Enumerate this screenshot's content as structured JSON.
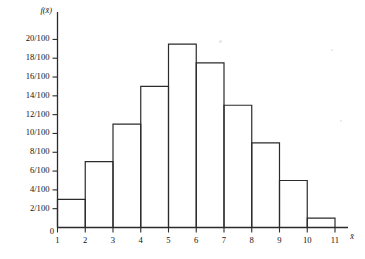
{
  "chart_data": {
    "type": "bar",
    "title": "",
    "xlabel": "x̄",
    "ylabel": "f(x̄)",
    "grid": false,
    "legend": "none",
    "bin_edges": [
      1,
      2,
      3,
      4,
      5,
      6,
      7,
      8,
      9,
      10,
      11
    ],
    "categories": [
      "1-2",
      "2-3",
      "3-4",
      "4-5",
      "5-6",
      "6-7",
      "7-8",
      "8-9",
      "9-10",
      "10-11"
    ],
    "values": [
      0.03,
      0.07,
      0.11,
      0.15,
      0.195,
      0.175,
      0.13,
      0.09,
      0.05,
      0.01
    ],
    "value_labels": [
      "3/100",
      "7/100",
      "11/100",
      "15/100",
      "19.5/100",
      "17.5/100",
      "13/100",
      "9/100",
      "5/100",
      "1/100"
    ],
    "xlim": [
      1,
      11
    ],
    "ylim": [
      0,
      0.21
    ],
    "x_ticks": [
      1,
      2,
      3,
      4,
      5,
      6,
      7,
      8,
      9,
      10,
      11
    ],
    "x_tick_labels": [
      "1",
      "2",
      "3",
      "4",
      "5",
      "6",
      "7",
      "8",
      "9",
      "10",
      "11"
    ],
    "y_ticks": [
      0.02,
      0.04,
      0.06,
      0.08,
      0.1,
      0.12,
      0.14,
      0.16,
      0.18,
      0.2
    ],
    "y_tick_labels": [
      "2/100",
      "4/100",
      "6/100",
      "8/100",
      "10/100",
      "12/100",
      "14/100",
      "16/100",
      "18/100",
      "20/100"
    ],
    "origin_label": "0"
  }
}
